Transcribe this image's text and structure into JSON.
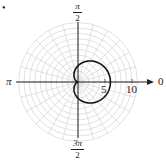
{
  "chart_data": {
    "type": "line",
    "subtype": "polar",
    "title": "",
    "equation": "r = 3 + 3cos(θ)",
    "series": [
      {
        "name": "cardioid",
        "color": "#111111",
        "r_max": 6,
        "cusp_at": "origin"
      }
    ],
    "angle_labels": {
      "right": "0",
      "top_num": "π",
      "top_den": "2",
      "left": "π",
      "bottom_num": "3π",
      "bottom_den": "2"
    },
    "radial_tick_labels": [
      "5",
      "10"
    ],
    "grid": {
      "circles_step": 1,
      "max_radius": 11,
      "radial_lines_step_deg": 15
    },
    "bullet": "•"
  }
}
